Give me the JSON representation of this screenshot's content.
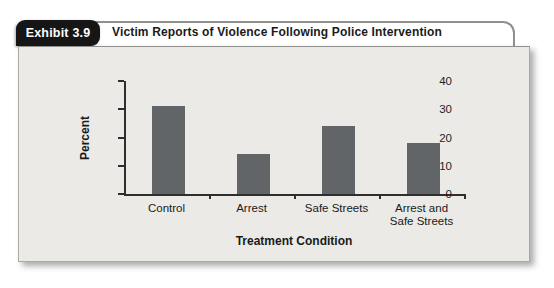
{
  "header": {
    "tab_label": "Exhibit 3.9",
    "title": "Victim Reports of Violence Following Police Intervention"
  },
  "chart_data": {
    "type": "bar",
    "categories": [
      "Control",
      "Arrest",
      "Safe Streets",
      "Arrest and Safe Streets"
    ],
    "values": [
      31,
      14,
      24,
      18
    ],
    "title": "Victim Reports of Violence Following Police Intervention",
    "xlabel": "Treatment Condition",
    "ylabel": "Percent",
    "ylim": [
      0,
      40
    ],
    "yticks": [
      0,
      10,
      20,
      30,
      40
    ],
    "grid": false,
    "legend": "none",
    "bar_color": "#626567"
  },
  "colors": {
    "tab_bg": "#161616",
    "tab_text": "#ffffff",
    "panel_bg": "#ebeae6",
    "outline": "#8f8f8c",
    "axis": "#2e2e2e",
    "bar": "#626567",
    "text": "#1a1a1a"
  }
}
